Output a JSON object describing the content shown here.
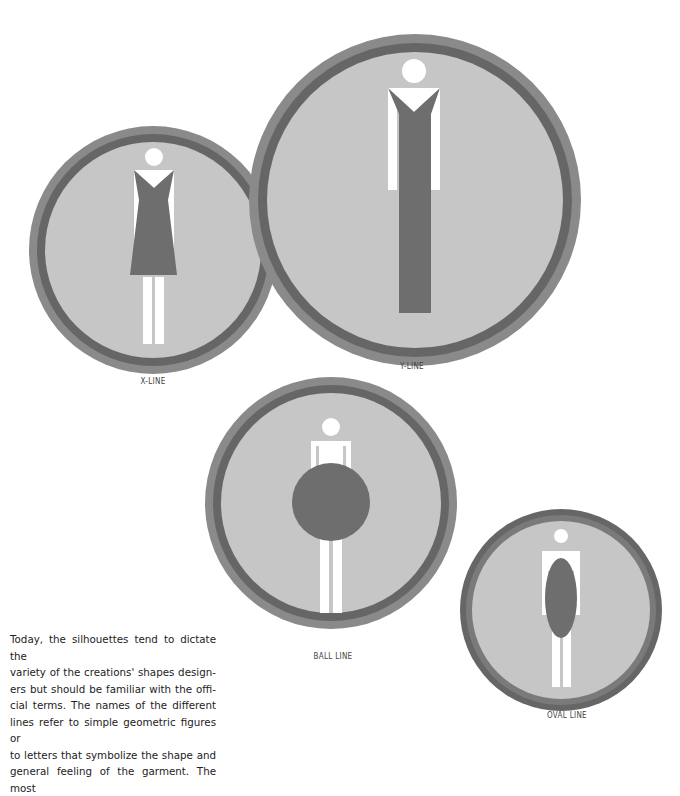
{
  "figures": [
    {
      "id": "x-line",
      "label": "X-LINE"
    },
    {
      "id": "y-line",
      "label": "Y-LINE"
    },
    {
      "id": "ball-line",
      "label": "BALL LINE"
    },
    {
      "id": "oval-line",
      "label": "OVAL LINE"
    }
  ],
  "paragraph": {
    "lines": [
      "Today, the silhouettes tend to dictate the",
      "variety of the creations' shapes design-",
      "ers but should be familiar with the offi-",
      "cial terms. The names of the different",
      "lines refer to simple geometric figures or",
      "to letters that symbolize the shape and",
      "general feeling of the garment. The most"
    ]
  },
  "colors": {
    "outer_ring": "#8a8a8a",
    "dark_ring": "#6a6a6a",
    "circle_fill": "#c6c6c6",
    "garment": "#6e6e6e",
    "figure": "#ffffff"
  }
}
